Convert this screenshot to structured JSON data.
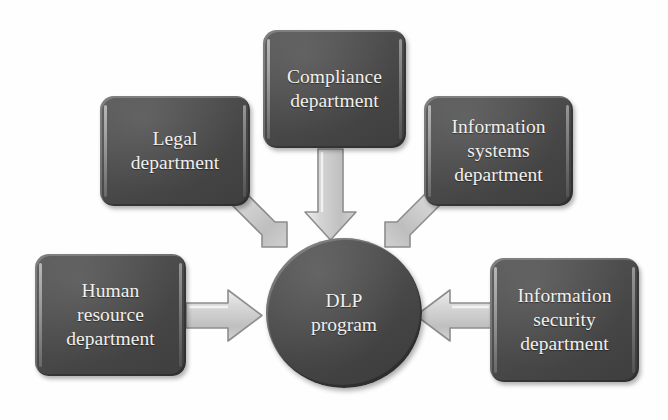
{
  "diagram": {
    "type": "hub-and-spoke",
    "colors": {
      "node_fill": "#4a4a4a",
      "node_text": "#f2f0ec",
      "arrow_fill": "#c9c9c9",
      "arrow_outline": "#8a8a8a",
      "background": "#ffffff"
    },
    "center": {
      "id": "dlp-program",
      "line1": "DLP",
      "line2": "program",
      "shape": "circle"
    },
    "nodes": [
      {
        "id": "legal",
        "line1": "Legal",
        "line2": "department",
        "line3": ""
      },
      {
        "id": "compliance",
        "line1": "Compliance",
        "line2": "department",
        "line3": ""
      },
      {
        "id": "info-systems",
        "line1": "Information",
        "line2": "systems",
        "line3": "department"
      },
      {
        "id": "human-resource",
        "line1": "Human",
        "line2": "resource",
        "line3": "department"
      },
      {
        "id": "info-security",
        "line1": "Information",
        "line2": "security",
        "line3": "department"
      }
    ],
    "arrows": [
      {
        "id": "legal-to-center",
        "from": "legal",
        "to": "dlp-program",
        "direction": "down-right"
      },
      {
        "id": "compliance-to-center",
        "from": "compliance",
        "to": "dlp-program",
        "direction": "down"
      },
      {
        "id": "info-systems-to-center",
        "from": "info-systems",
        "to": "dlp-program",
        "direction": "down-left"
      },
      {
        "id": "human-resource-to-center",
        "from": "human-resource",
        "to": "dlp-program",
        "direction": "right"
      },
      {
        "id": "info-security-to-center",
        "from": "info-security",
        "to": "dlp-program",
        "direction": "left"
      }
    ]
  }
}
